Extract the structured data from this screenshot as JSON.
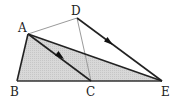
{
  "diagram": {
    "type": "geometry",
    "points": {
      "A": {
        "label": "A",
        "x": 28,
        "y": 34
      },
      "B": {
        "label": "B",
        "x": 17,
        "y": 81
      },
      "C": {
        "label": "C",
        "x": 91,
        "y": 81
      },
      "D": {
        "label": "D",
        "x": 77,
        "y": 18
      },
      "E": {
        "label": "E",
        "x": 162,
        "y": 81
      }
    },
    "shaded_region": "triangle ABE",
    "segments": [
      {
        "from": "A",
        "to": "B",
        "style": "thick"
      },
      {
        "from": "B",
        "to": "E",
        "style": "thick"
      },
      {
        "from": "A",
        "to": "E",
        "style": "thick"
      },
      {
        "from": "A",
        "to": "C",
        "style": "thick",
        "arrow": true
      },
      {
        "from": "D",
        "to": "E",
        "style": "thick",
        "arrow": true
      },
      {
        "from": "A",
        "to": "D",
        "style": "thin"
      },
      {
        "from": "D",
        "to": "C",
        "style": "thin"
      }
    ],
    "colors": {
      "fill": "#d4d4d4",
      "thick_line": "#222222",
      "thin_line": "#999999"
    }
  }
}
